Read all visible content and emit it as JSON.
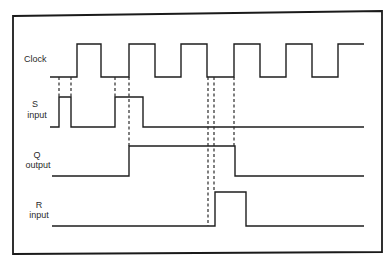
{
  "diagram": {
    "signals": [
      {
        "id": "clock",
        "label_line1": "Clock",
        "label_line2": ""
      },
      {
        "id": "s",
        "label_line1": "S",
        "label_line2": "input"
      },
      {
        "id": "q",
        "label_line1": "Q",
        "label_line2": "output"
      },
      {
        "id": "r",
        "label_line1": "R",
        "label_line2": "input"
      }
    ],
    "colors": {
      "line": "#1e1e1e",
      "background": "#ffffff"
    },
    "waveforms": {
      "clock": {
        "low_y": 77,
        "high_y": 44,
        "start_x": 50,
        "end_x": 364,
        "initial_level": "low",
        "transitions_x": [
          77,
          101,
          129,
          155,
          181,
          207,
          234,
          260,
          286,
          312,
          338
        ]
      },
      "s": {
        "low_y": 127,
        "high_y": 97,
        "start_x": 50,
        "end_x": 364,
        "initial_level": "low",
        "transitions_x": [
          59,
          71,
          115,
          143
        ]
      },
      "q": {
        "low_y": 176,
        "high_y": 146,
        "start_x": 52,
        "end_x": 364,
        "initial_level": "low",
        "transitions_x": [
          129,
          235
        ]
      },
      "r": {
        "low_y": 226,
        "high_y": 192,
        "start_x": 52,
        "end_x": 364,
        "initial_level": "low",
        "transitions_x": [
          215,
          246
        ]
      }
    },
    "dashed_guides": [
      {
        "x": 59,
        "y1": 77,
        "y2": 97
      },
      {
        "x": 71,
        "y1": 77,
        "y2": 97
      },
      {
        "x": 115,
        "y1": 77,
        "y2": 97
      },
      {
        "x": 129,
        "y1": 77,
        "y2": 146
      },
      {
        "x": 208,
        "y1": 77,
        "y2": 226
      },
      {
        "x": 214,
        "y1": 77,
        "y2": 192
      },
      {
        "x": 234,
        "y1": 77,
        "y2": 146
      }
    ]
  }
}
